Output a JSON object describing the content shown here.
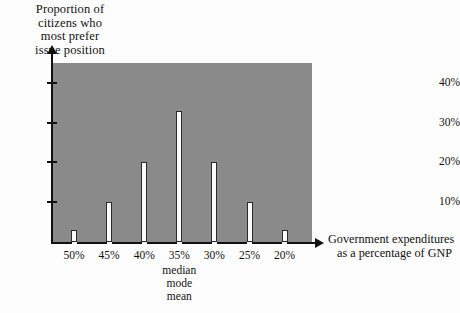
{
  "chart_data": {
    "type": "bar",
    "title": "",
    "ylabel": "Proportion of citizens who most prefer issue position",
    "ylabel_lines": [
      "Proportion of",
      "citizens who",
      "most prefer",
      "issue position"
    ],
    "xlabel": "Government expenditures as a percentage of GNP",
    "xlabel_lines": [
      "Government expenditures",
      "as a percentage of GNP"
    ],
    "categories": [
      "50%",
      "45%",
      "40%",
      "35%",
      "30%",
      "25%",
      "20%"
    ],
    "values": [
      3,
      10,
      20,
      33,
      20,
      10,
      3
    ],
    "ylim": [
      0,
      45
    ],
    "yticks": [
      10,
      20,
      30,
      40
    ],
    "ytick_labels": [
      "10%",
      "20%",
      "30%",
      "40%"
    ],
    "grid": false,
    "legend": false,
    "annotations": [
      "median",
      "mode",
      "mean"
    ],
    "annotation_at_category": "35%",
    "colors": {
      "panel": "#8a8a8a",
      "bar_fill": "#fbfbfb",
      "bar_stroke": "#2a2a2a",
      "axis": "#111111",
      "background": "#fdfdfd"
    }
  }
}
